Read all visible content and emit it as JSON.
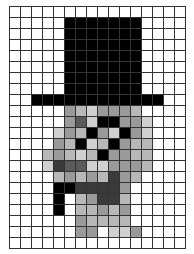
{
  "grid": {
    "cols": 16,
    "rows": 22,
    "palette": {
      "W": "#ffffff",
      "K": "#000000",
      "D": "#3a3a3a",
      "M": "#5a5a5a",
      "G": "#9a9a9a",
      "L": "#b8b8b8",
      "P": "#d0d0d0"
    },
    "pixels": [
      "WWWWWWWWWWWWWWWW",
      "WWWWWKKKKKKKWWWW",
      "WWWWWKKKKKKKWWWW",
      "WWWWWKKKKKKKWWWW",
      "WWWWWKKKKKKKWWWW",
      "WWWWWKKKKKKKWWWW",
      "WWWWWKKKKKKKWWWW",
      "WWWWWKKKKKKKWWWW",
      "WWKKKKKKKKKKKKWW",
      "WWWWWGLPGGGLWWWW",
      "WWWWWGMPKKGGPWWW",
      "WWWWPGLKGPKGPWWW",
      "WWWWGLKPLKGLLWWW",
      "WWWLGLPLKGGLLWWW",
      "WWWPDMMPPGGGLWWW",
      "WWWWLGLGLDGLWWWW",
      "WWWWKKDDDDGWWWWW",
      "WWWWKWLGDDLWWWWW",
      "WWWWKWLLGLGWWWWW",
      "WWWWWWGLLLLWWWWW",
      "WWWWWWGGWPPGWWWW",
      "WWWWWWWWWWWWWWWW"
    ]
  }
}
